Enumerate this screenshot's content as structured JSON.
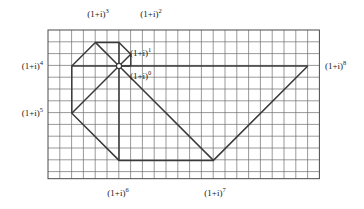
{
  "figure": {
    "colors": {
      "background": "#ffffff",
      "grid_line": "#6e6e6e",
      "grid_border": "#4a4a4a",
      "spiral_line": "#3a3a3a",
      "label_text": "#1a1a1a",
      "node_fill": "#ffffff"
    },
    "grid": {
      "x0": 48,
      "y0": 30,
      "cell": 11.8,
      "cols": 23,
      "rows": 12.6,
      "show_border": true
    },
    "origin": {
      "x": 119,
      "y": 66
    },
    "labels": [
      {
        "id": "p3",
        "base": "(1+i)",
        "exp": "3",
        "x": 98,
        "y": 14,
        "align": "c"
      },
      {
        "id": "p2",
        "base": "(1+i)",
        "exp": "2",
        "x": 151,
        "y": 14,
        "align": "c"
      },
      {
        "id": "p1",
        "base": "(1+i)",
        "exp": "1",
        "x": 130,
        "y": 53,
        "align": "l"
      },
      {
        "id": "p0",
        "base": "(1+i)",
        "exp": "0",
        "x": 130,
        "y": 76,
        "align": "l"
      },
      {
        "id": "p4",
        "base": "(1+i)",
        "exp": "4",
        "x": 43,
        "y": 66,
        "align": "r"
      },
      {
        "id": "p5",
        "base": "(1+i)",
        "exp": "5",
        "x": 43,
        "y": 113,
        "align": "r"
      },
      {
        "id": "p8",
        "base": "(1+i)",
        "exp": "8",
        "x": 325,
        "y": 66,
        "align": "l"
      },
      {
        "id": "p6",
        "base": "(1+i)",
        "exp": "6",
        "x": 118,
        "y": 193,
        "align": "c"
      },
      {
        "id": "p7",
        "base": "(1+i)",
        "exp": "7",
        "x": 215,
        "y": 193,
        "align": "c"
      }
    ],
    "vertices": [
      {
        "name": "(1+i)^0",
        "gx": 1,
        "gy": 0
      },
      {
        "name": "(1+i)^1",
        "gx": 1,
        "gy": 1
      },
      {
        "name": "(1+i)^2",
        "gx": 0,
        "gy": 2
      },
      {
        "name": "(1+i)^3",
        "gx": -2,
        "gy": 2
      },
      {
        "name": "(1+i)^4",
        "gx": -4,
        "gy": 0
      },
      {
        "name": "(1+i)^5",
        "gx": -4,
        "gy": -4
      },
      {
        "name": "(1+i)^6",
        "gx": 0,
        "gy": -8
      },
      {
        "name": "(1+i)^7",
        "gx": 8,
        "gy": -8
      },
      {
        "name": "(1+i)^8",
        "gx": 16,
        "gy": 0
      }
    ],
    "spokes": [
      {
        "from": "origin",
        "to": "(1+i)^0"
      },
      {
        "from": "origin",
        "to": "(1+i)^1"
      },
      {
        "from": "origin",
        "to": "(1+i)^2"
      },
      {
        "from": "origin",
        "to": "(1+i)^3"
      },
      {
        "from": "origin",
        "to": "(1+i)^4"
      },
      {
        "from": "origin",
        "to": "(1+i)^5"
      },
      {
        "from": "origin",
        "to": "(1+i)^6"
      },
      {
        "from": "origin",
        "to": "(1+i)^7"
      },
      {
        "from": "origin",
        "to": "(1+i)^8"
      }
    ],
    "chain": [
      "(1+i)^0",
      "(1+i)^1",
      "(1+i)^2",
      "(1+i)^3",
      "(1+i)^4",
      "(1+i)^5",
      "(1+i)^6",
      "(1+i)^7",
      "(1+i)^8"
    ],
    "origin_node": {
      "shape": "circle",
      "radius": 2.6
    }
  },
  "chart_data": {
    "type": "scatter",
    "xlabel": "",
    "ylabel": "",
    "grid": true,
    "legend": "none",
    "categories": [
      "(1+i)^0",
      "(1+i)^1",
      "(1+i)^2",
      "(1+i)^3",
      "(1+i)^4",
      "(1+i)^5",
      "(1+i)^6",
      "(1+i)^7",
      "(1+i)^8"
    ],
    "series": [
      {
        "name": "real part",
        "values": [
          1,
          1,
          0,
          -2,
          -4,
          -4,
          0,
          8,
          16
        ]
      },
      {
        "name": "imaginary part",
        "values": [
          0,
          1,
          2,
          2,
          0,
          -4,
          -8,
          -8,
          0
        ]
      }
    ],
    "points": [
      {
        "label": "(1+i)^0",
        "x": 1,
        "y": 0
      },
      {
        "label": "(1+i)^1",
        "x": 1,
        "y": 1
      },
      {
        "label": "(1+i)^2",
        "x": 0,
        "y": 2
      },
      {
        "label": "(1+i)^3",
        "x": -2,
        "y": 2
      },
      {
        "label": "(1+i)^4",
        "x": -4,
        "y": 0
      },
      {
        "label": "(1+i)^5",
        "x": -4,
        "y": -4
      },
      {
        "label": "(1+i)^6",
        "x": 0,
        "y": -8
      },
      {
        "label": "(1+i)^7",
        "x": 8,
        "y": -8
      },
      {
        "label": "(1+i)^8",
        "x": 16,
        "y": 0
      }
    ],
    "xlim": [
      -6,
      17
    ],
    "ylim": [
      -9,
      4
    ]
  }
}
